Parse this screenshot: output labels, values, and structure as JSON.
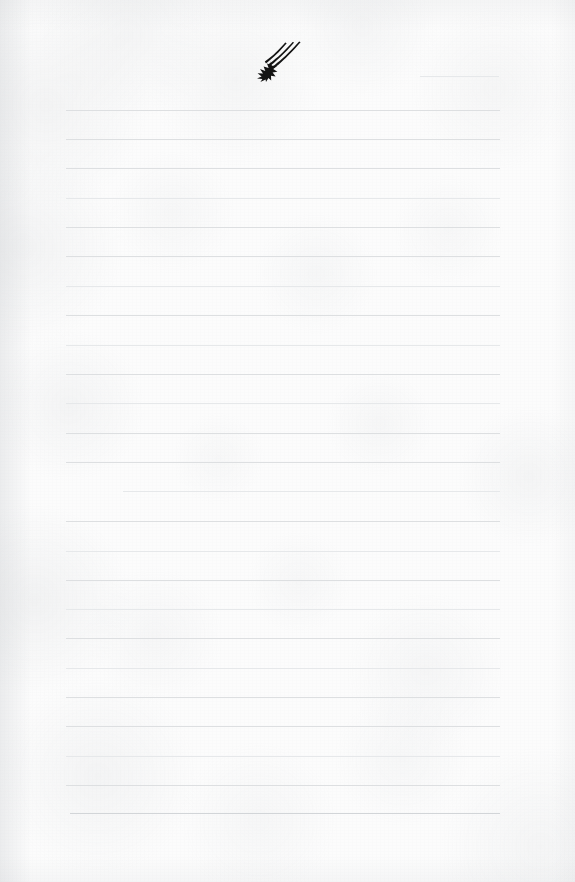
{
  "page": {
    "kind": "lined-notebook-paper",
    "width": 575,
    "height": 882,
    "paper_color": "#fcfcfc",
    "rule_color": "#dddfe1",
    "ink_color": "#1a1a1a",
    "text_content": "",
    "handwriting_present": false
  },
  "doodle": {
    "name": "shooting-star",
    "description": "hand-drawn black shooting star: five-pointed starburst at lower-left with three tapering curved motion trails sweeping up to the right",
    "ink_color": "#141414",
    "x": 255,
    "y": 40,
    "width": 48,
    "height": 42,
    "trail_count": 3
  },
  "ruled_lines": [
    {
      "id": "line-01",
      "y": 76,
      "x1": 420,
      "x2": 499,
      "weight": "faint",
      "note": "short partial rule, top-right only"
    },
    {
      "id": "line-02",
      "y": 110,
      "x1": 66,
      "x2": 500,
      "weight": "normal"
    },
    {
      "id": "line-03",
      "y": 139,
      "x1": 66,
      "x2": 500,
      "weight": "normal"
    },
    {
      "id": "line-04",
      "y": 168,
      "x1": 66,
      "x2": 500,
      "weight": "normal"
    },
    {
      "id": "line-05",
      "y": 198,
      "x1": 66,
      "x2": 500,
      "weight": "faint"
    },
    {
      "id": "line-06",
      "y": 227,
      "x1": 66,
      "x2": 500,
      "weight": "normal"
    },
    {
      "id": "line-07",
      "y": 256,
      "x1": 66,
      "x2": 500,
      "weight": "normal"
    },
    {
      "id": "line-08",
      "y": 286,
      "x1": 66,
      "x2": 500,
      "weight": "faint"
    },
    {
      "id": "line-09",
      "y": 315,
      "x1": 66,
      "x2": 500,
      "weight": "normal"
    },
    {
      "id": "line-10",
      "y": 345,
      "x1": 66,
      "x2": 500,
      "weight": "faint"
    },
    {
      "id": "line-11",
      "y": 374,
      "x1": 66,
      "x2": 500,
      "weight": "normal"
    },
    {
      "id": "line-12",
      "y": 403,
      "x1": 66,
      "x2": 500,
      "weight": "faint"
    },
    {
      "id": "line-13",
      "y": 433,
      "x1": 66,
      "x2": 500,
      "weight": "normal"
    },
    {
      "id": "line-14",
      "y": 462,
      "x1": 66,
      "x2": 500,
      "weight": "normal"
    },
    {
      "id": "line-15",
      "y": 491,
      "x1": 123,
      "x2": 500,
      "weight": "faint",
      "note": "rule begins indented"
    },
    {
      "id": "line-16",
      "y": 521,
      "x1": 66,
      "x2": 500,
      "weight": "normal"
    },
    {
      "id": "line-17",
      "y": 551,
      "x1": 66,
      "x2": 500,
      "weight": "faint"
    },
    {
      "id": "line-18",
      "y": 580,
      "x1": 66,
      "x2": 500,
      "weight": "normal"
    },
    {
      "id": "line-19",
      "y": 609,
      "x1": 66,
      "x2": 500,
      "weight": "faint"
    },
    {
      "id": "line-20",
      "y": 638,
      "x1": 66,
      "x2": 500,
      "weight": "normal"
    },
    {
      "id": "line-21",
      "y": 668,
      "x1": 66,
      "x2": 500,
      "weight": "faint"
    },
    {
      "id": "line-22",
      "y": 697,
      "x1": 66,
      "x2": 500,
      "weight": "normal"
    },
    {
      "id": "line-23",
      "y": 726,
      "x1": 66,
      "x2": 500,
      "weight": "normal"
    },
    {
      "id": "line-24",
      "y": 756,
      "x1": 66,
      "x2": 500,
      "weight": "faint"
    },
    {
      "id": "line-25",
      "y": 785,
      "x1": 66,
      "x2": 500,
      "weight": "normal"
    },
    {
      "id": "line-26",
      "y": 813,
      "x1": 70,
      "x2": 500,
      "weight": "strong"
    }
  ]
}
